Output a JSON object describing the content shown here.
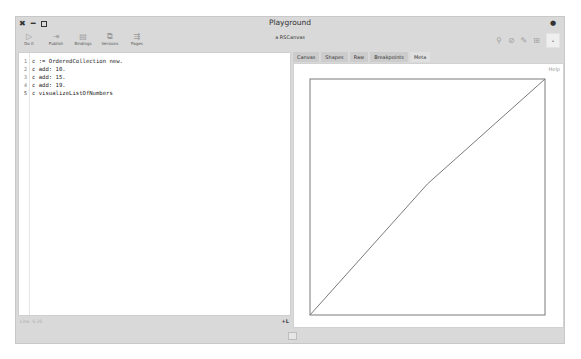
{
  "window": {
    "title": "Playground",
    "controls": [
      "close",
      "minimize",
      "maximize"
    ],
    "menu_icon": "menu-dot-icon"
  },
  "toolbar": {
    "tools": [
      {
        "label": "Do it",
        "icon": "▷",
        "icon_name": "play-icon"
      },
      {
        "label": "Publish",
        "icon": "⇥",
        "icon_name": "publish-icon"
      },
      {
        "label": "Bindings",
        "icon": "▤",
        "icon_name": "bindings-icon"
      },
      {
        "label": "Versions",
        "icon": "⧉",
        "icon_name": "versions-icon"
      },
      {
        "label": "Pages",
        "icon": "⇶",
        "icon_name": "pages-icon"
      }
    ],
    "inspector_title": "a RSCanvas",
    "right_tools": [
      {
        "icon": "⚲",
        "icon_name": "filter-icon"
      },
      {
        "icon": "⊘",
        "icon_name": "stop-icon"
      },
      {
        "icon": "✎",
        "icon_name": "edit-icon"
      },
      {
        "icon": "⊞",
        "icon_name": "grid-icon"
      }
    ],
    "right_box": "•"
  },
  "editor": {
    "lines": [
      {
        "n": "1",
        "code": "c := OrderedCollection new."
      },
      {
        "n": "2",
        "code": "c add: 10."
      },
      {
        "n": "3",
        "code": "c add: 15."
      },
      {
        "n": "4",
        "code": "c add: 19."
      },
      {
        "n": "5",
        "code": "c visualizeListOfNumbers"
      }
    ],
    "status": "Line: 5:25",
    "plus_label": "+L"
  },
  "inspector": {
    "tabs": [
      "Canvas",
      "Shapes",
      "Raw",
      "Breakpoints",
      "Meta"
    ],
    "active_tab": "Meta",
    "help_label": "Help"
  },
  "chart_data": {
    "type": "line",
    "x": [
      1,
      2,
      3
    ],
    "values": [
      10,
      15,
      19
    ],
    "title": "",
    "xlabel": "",
    "ylabel": "",
    "grid": false,
    "frame": true,
    "colors": {
      "line": "#7a7a7a",
      "frame": "#7a7a7a"
    }
  }
}
